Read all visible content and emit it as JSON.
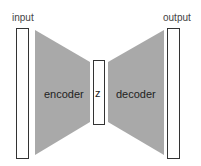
{
  "diagram": {
    "type": "autoencoder",
    "labels": {
      "input": "input",
      "encoder": "encoder",
      "latent": "z",
      "decoder": "decoder",
      "output": "output"
    },
    "colors": {
      "trapezoid_fill": "#a9a9a9",
      "box_stroke": "#333333",
      "box_fill": "#ffffff"
    }
  }
}
